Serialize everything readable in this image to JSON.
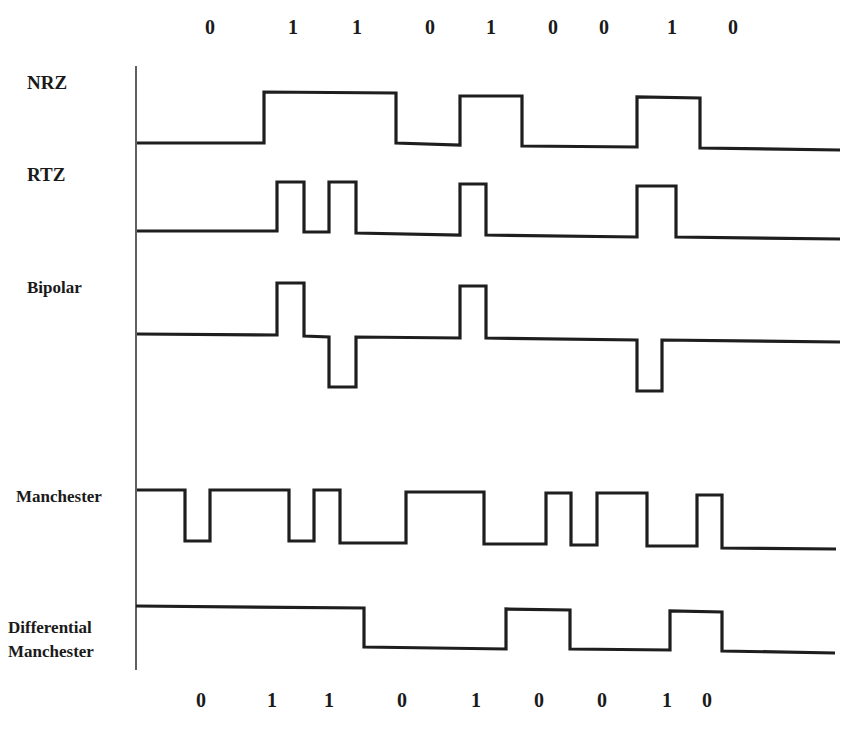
{
  "top_bits": {
    "values": [
      "0",
      "1",
      "1",
      "0",
      "1",
      "0",
      "0",
      "1",
      "0"
    ],
    "x": [
      210,
      293,
      357,
      430,
      491,
      553,
      604,
      672,
      733
    ],
    "y": 30
  },
  "bottom_bits": {
    "values": [
      "0",
      "1",
      "1",
      "0",
      "1",
      "0",
      "0",
      "1",
      "0"
    ],
    "x": [
      201,
      272,
      329,
      402,
      476,
      539,
      602,
      667,
      707
    ],
    "y": 703
  },
  "encodings": [
    {
      "name": "NRZ",
      "label_x": 27,
      "label_y": 84,
      "points": "137,143 264,143 264,92 396,93 396,143 460,145 460,96 522,96 522,146 637,147 637,97 700,98 700,148 840,150"
    },
    {
      "name": "RTZ",
      "label_x": 27,
      "label_y": 176,
      "points": "137,231 277,231 277,182 304,182 304,232 329,232 329,182 356,182 356,233 460,235 460,184 486,184 486,235 637,237 637,186 676,186 676,237 840,239"
    },
    {
      "name": "Bipolar",
      "label_x": 27,
      "label_y": 288,
      "points": "137,334 277,335 277,283 304,283 304,336 329,337 329,387 356,387 356,337 460,338 460,286 486,286 486,338 637,340 637,391 662,391 662,340 840,342"
    },
    {
      "name": "Manchester",
      "label_x": 16,
      "label_y": 496,
      "points": "137,490 185,490 185,541 210,541 210,490 289,490 289,541 314,541 314,490 340,490 340,543 406,543 406,492 484,492 484,544 546,544 546,493 571,493 571,545 597,545 597,493 647,493 647,546 697,546 697,495 722,495 722,548 836,549"
    },
    {
      "name": "Differential Manchester",
      "label_lines": [
        "Differential",
        "Manchester"
      ],
      "label_x": 8,
      "label_y": 627,
      "points": "136,606 364,608 364,647 506,649 506,609 570,610 570,649 670,650 670,611 722,612 722,651 835,653"
    }
  ],
  "axis": {
    "x": 136,
    "y_top": 66,
    "y_bottom": 670
  },
  "chart_data": {
    "type": "diagram",
    "title": "",
    "bit_sequence": [
      0,
      1,
      1,
      0,
      1,
      0,
      0,
      1,
      0
    ],
    "rows": [
      "NRZ",
      "RTZ",
      "Bipolar",
      "Manchester",
      "Differential Manchester"
    ]
  }
}
